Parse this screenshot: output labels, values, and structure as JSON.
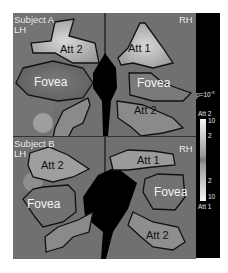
{
  "figure": {
    "panels": [
      {
        "id": "A",
        "subject_label": "Subject A",
        "left_hemi": "LH",
        "right_hemi": "RH",
        "regions": [
          {
            "label": "Att 2",
            "hemi": "LH"
          },
          {
            "label": "Fovea",
            "hemi": "LH"
          },
          {
            "label": "Att 1",
            "hemi": "RH"
          },
          {
            "label": "Fovea",
            "hemi": "RH"
          },
          {
            "label": "Att 2",
            "hemi": "RH"
          }
        ]
      },
      {
        "id": "B",
        "subject_label": "Subject B",
        "left_hemi": "LH",
        "right_hemi": "RH",
        "regions": [
          {
            "label": "Att 2",
            "hemi": "LH"
          },
          {
            "label": "Fovea",
            "hemi": "LH"
          },
          {
            "label": "Att 1",
            "hemi": "RH"
          },
          {
            "label": "Fovea",
            "hemi": "RH"
          },
          {
            "label": "Att 2",
            "hemi": "RH"
          }
        ]
      }
    ],
    "colorbar": {
      "p_label": "p=10",
      "p_exponent": "-x",
      "top_label": "Att 2",
      "bottom_label": "Att 1",
      "ticks": [
        "10",
        "2",
        "2",
        "10"
      ]
    },
    "colors": {
      "background": "#ffffff",
      "brain": "#6e6e6e",
      "outline": "#111111",
      "colorbar_strip": "#000000"
    }
  }
}
